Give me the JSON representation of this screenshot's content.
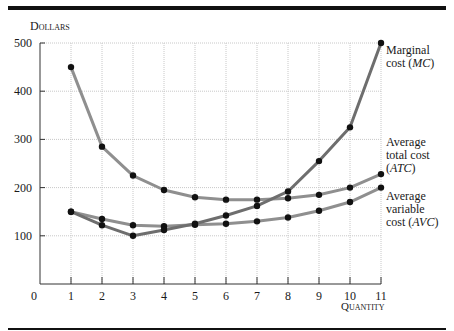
{
  "chart_data": {
    "type": "line",
    "title": "",
    "xlabel": "Quantity",
    "ylabel": "Dollars",
    "x": [
      1,
      2,
      3,
      4,
      5,
      6,
      7,
      8,
      9,
      10,
      11
    ],
    "xticks": [
      "0",
      "1",
      "2",
      "3",
      "4",
      "5",
      "6",
      "7",
      "8",
      "9",
      "10",
      "11"
    ],
    "yticks": [
      "100",
      "200",
      "300",
      "400",
      "500"
    ],
    "xlim": [
      0,
      11
    ],
    "ylim": [
      0,
      500
    ],
    "grid": true,
    "legend_position": "right-inline",
    "series": [
      {
        "name": "Marginal cost (MC)",
        "key": "mc",
        "values": [
          150,
          122,
          100,
          112,
          125,
          142,
          162,
          192,
          255,
          325,
          500
        ]
      },
      {
        "name": "Average total cost (ATC)",
        "key": "atc",
        "values": [
          450,
          285,
          225,
          195,
          180,
          175,
          175,
          178,
          185,
          200,
          228
        ]
      },
      {
        "name": "Average variable cost (AVC)",
        "key": "avc",
        "values": [
          150,
          135,
          122,
          120,
          123,
          125,
          130,
          138,
          152,
          170,
          200
        ]
      }
    ],
    "colors": {
      "mc": "#6e6e6e",
      "atc": "#8f8f8f",
      "avc": "#8f8f8f",
      "marker": "#111111",
      "grid": "#c8c8c8",
      "axis": "#333333",
      "rule": "#111111"
    }
  },
  "labels": {
    "y_axis_title": "Dollars",
    "x_axis_title": "Quantity",
    "mc_line1": "Marginal",
    "mc_line2_pre": "cost (",
    "mc_abbr": "MC",
    "mc_line2_post": ")",
    "atc_line1": "Average",
    "atc_line2": "total cost",
    "atc_line3_pre": "(",
    "atc_abbr": "ATC",
    "atc_line3_post": ")",
    "avc_line1": "Average",
    "avc_line2": "variable",
    "avc_line3_pre": "cost (",
    "avc_abbr": "AVC",
    "avc_line3_post": ")"
  }
}
